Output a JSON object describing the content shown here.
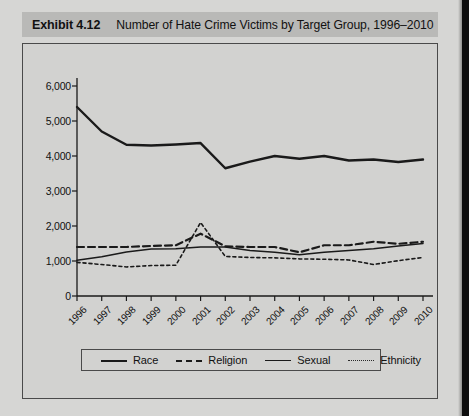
{
  "exhibit": {
    "number_label": "Exhibit 4.12",
    "caption": "Number of Hate Crime Victims by Target Group, 1996–2010"
  },
  "colors": {
    "page_background": "#d6d6d4",
    "title_band": "#b9b9b7",
    "plot_background": "#d2d2d0",
    "frame_border": "#4a4a4a",
    "line_color": "#1a1a1a",
    "gutter": "#0d0d0d"
  },
  "chart_data": {
    "type": "line",
    "title": "Number of Hate Crime Victims by Target Group, 1996–2010",
    "xlabel": "",
    "ylabel": "",
    "x": [
      1996,
      1997,
      1998,
      1999,
      2000,
      2001,
      2002,
      2003,
      2004,
      2005,
      2006,
      2007,
      2008,
      2009,
      2010
    ],
    "xtick_labels": [
      "1996",
      "1997",
      "1998",
      "1999",
      "2000",
      "2001",
      "2002",
      "2003",
      "2004",
      "2005",
      "2006",
      "2007",
      "2008",
      "2009",
      "2010"
    ],
    "ytick_labels": [
      "0",
      "1,000",
      "2,000",
      "3,000",
      "4,000",
      "5,000",
      "6,000"
    ],
    "yticks": [
      0,
      1000,
      2000,
      3000,
      4000,
      5000,
      6000
    ],
    "ylim": [
      0,
      6000
    ],
    "xlim": [
      1996,
      2010
    ],
    "grid": false,
    "legend_position": "bottom",
    "series": [
      {
        "name": "Race",
        "style": "solid-thick",
        "values": [
          5400,
          4700,
          4320,
          4300,
          4330,
          4370,
          3650,
          3840,
          4000,
          3920,
          4000,
          3870,
          3900,
          3830,
          3900
        ]
      },
      {
        "name": "Religion",
        "style": "dashed-bold",
        "values": [
          1400,
          1400,
          1400,
          1430,
          1450,
          1780,
          1420,
          1400,
          1400,
          1250,
          1450,
          1450,
          1550,
          1490,
          1550
        ]
      },
      {
        "name": "Sexual",
        "style": "solid-thin",
        "values": [
          1020,
          1120,
          1260,
          1340,
          1350,
          1400,
          1400,
          1300,
          1250,
          1180,
          1250,
          1300,
          1350,
          1430,
          1500
        ]
      },
      {
        "name": "Ethnicity",
        "style": "dotted-fine",
        "values": [
          960,
          900,
          830,
          870,
          880,
          2100,
          1130,
          1100,
          1090,
          1060,
          1050,
          1030,
          900,
          1010,
          1100
        ]
      }
    ]
  },
  "legend": {
    "items": [
      {
        "label": "Race",
        "style": "solid-thick"
      },
      {
        "label": "Religion",
        "style": "dashed-bold"
      },
      {
        "label": "Sexual",
        "style": "solid-thin"
      },
      {
        "label": "Ethnicity",
        "style": "dotted-fine"
      }
    ]
  }
}
